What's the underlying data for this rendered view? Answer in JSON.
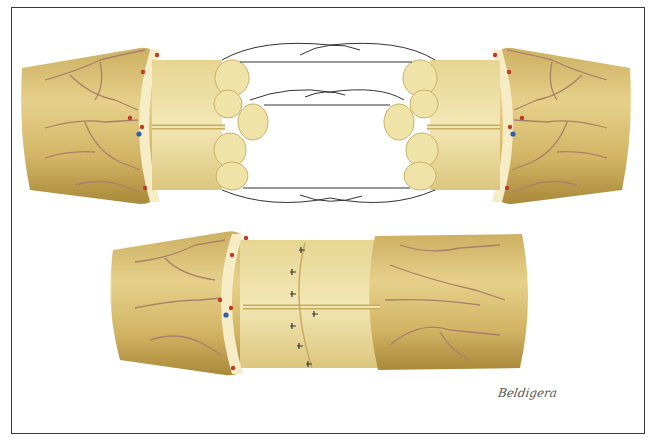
{
  "figure": {
    "type": "medical illustration",
    "panels": [
      {
        "id": "top",
        "description": "two severed nerve stumps with exposed fascicles and epineurial sutures placed before coaptation"
      },
      {
        "id": "bottom",
        "description": "repaired nerve with interrupted epineurial sutures across coapted ends"
      }
    ],
    "signature": "Beldigera",
    "colors": {
      "nerve_outer": "#d9bf6e",
      "nerve_dark": "#b8963c",
      "fascicle": "#efe2a6",
      "epineurium_rim": "#f6ecc6",
      "vessel": "#a8806a",
      "artery_dot": "#c0392b",
      "vein_dot": "#2e5fa8",
      "suture": "#333333",
      "frame": "#3a3a3a"
    }
  }
}
